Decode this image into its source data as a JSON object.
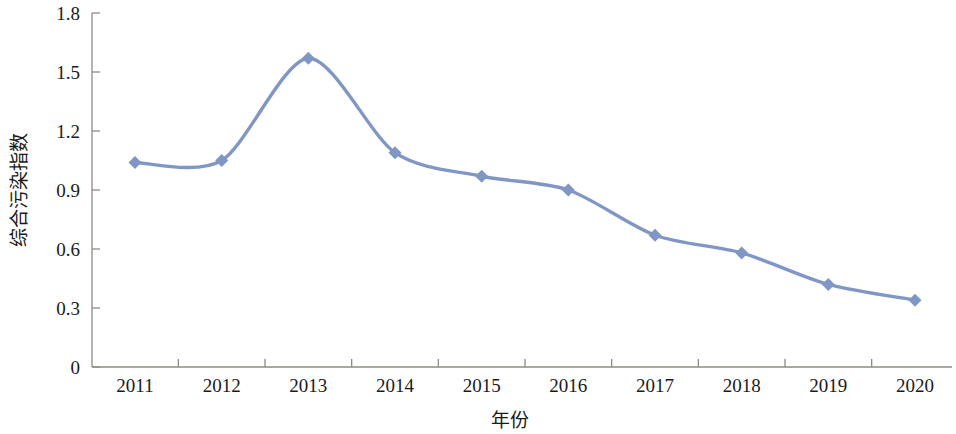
{
  "chart_data": {
    "type": "line",
    "title": "",
    "subtitle": "",
    "xlabel": "年份",
    "ylabel": "综合污染指数",
    "categories": [
      "2011",
      "2012",
      "2013",
      "2014",
      "2015",
      "2016",
      "2017",
      "2018",
      "2019",
      "2020"
    ],
    "values": [
      1.04,
      1.05,
      1.57,
      1.09,
      0.97,
      0.9,
      0.67,
      0.58,
      0.42,
      0.34
    ],
    "series": [
      {
        "name": "综合污染指数",
        "values": [
          1.04,
          1.05,
          1.57,
          1.09,
          0.97,
          0.9,
          0.67,
          0.58,
          0.42,
          0.34
        ]
      }
    ],
    "ylim": [
      0,
      1.8
    ],
    "yticks": [
      "0",
      "0.3",
      "0.6",
      "0.9",
      "1.2",
      "1.5",
      "1.8"
    ],
    "ytick_values": [
      0,
      0.3,
      0.6,
      0.9,
      1.2,
      1.5,
      1.8
    ],
    "xticks": [
      "2011",
      "2012",
      "2013",
      "2014",
      "2015",
      "2016",
      "2017",
      "2018",
      "2019",
      "2020"
    ],
    "grid": false,
    "legend": false,
    "legend_position": "none",
    "smooth": true,
    "marker": "diamond",
    "colors": {
      "series_line": "#8096c4",
      "marker_fill": "#8096c4",
      "axis": "#8d8d85",
      "text": "#1a1a1a",
      "background": "#ffffff"
    }
  },
  "axes": {
    "y_title": "综合污染指数",
    "x_title": "年份",
    "y_tick_labels": [
      "1.8",
      "1.5",
      "1.2",
      "0.9",
      "0.6",
      "0.3",
      "0"
    ],
    "x_tick_labels": [
      "2011",
      "2012",
      "2013",
      "2014",
      "2015",
      "2016",
      "2017",
      "2018",
      "2019",
      "2020"
    ]
  }
}
